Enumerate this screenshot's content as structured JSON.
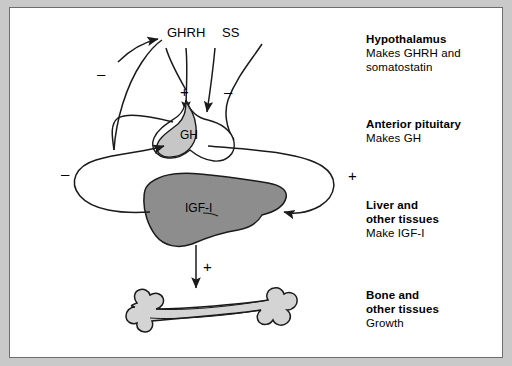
{
  "diagram": {
    "nodes": {
      "ghrh": "GHRH",
      "ss": "SS",
      "gh": "GH",
      "igf1": "IGF-I"
    },
    "signs": {
      "ghrh_stimulates_gh": "+",
      "ss_inhibits_gh": "–",
      "gh_feedback_hypothalamus": "–",
      "igf1_feedback_hypothalamus": "–",
      "gh_stimulates_liver": "+",
      "igf1_stimulates_bone": "+"
    },
    "labels": [
      {
        "id": "hypothalamus",
        "heading": "Hypothalamus",
        "lines": [
          "Makes GHRH and",
          "somatostatin"
        ]
      },
      {
        "id": "anterior-pituitary",
        "heading": "Anterior pituitary",
        "lines": [
          "Makes GH"
        ]
      },
      {
        "id": "liver",
        "heading": "Liver and",
        "heading2": "other tissues",
        "lines": [
          "Make IGF-I"
        ]
      },
      {
        "id": "bone",
        "heading": "Bone and",
        "heading2": "other tissues",
        "lines": [
          "Growth"
        ]
      }
    ],
    "colors": {
      "frame": "#c9c9c9",
      "border": "#6e6e6e",
      "pituitary_fill": "#c6c6c6",
      "liver_fill": "#8d8d8d",
      "bone_fill": "#d4d4d4",
      "stroke": "#1a1a1a"
    }
  }
}
